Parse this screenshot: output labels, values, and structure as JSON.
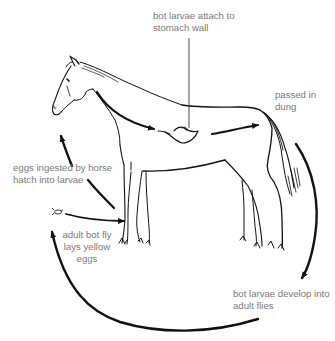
{
  "diagram": {
    "subject": "horse",
    "colors": {
      "background": "#ffffff",
      "line": "#111111",
      "label_text": "#7a7a7a"
    },
    "labels": {
      "stomach": {
        "line1": "bot larvae attach to",
        "line2": "stomach wall"
      },
      "dung": {
        "line1": "passed in",
        "line2": "dung"
      },
      "ingested": {
        "line1": "eggs ingested by horse",
        "line2": "hatch into larvae"
      },
      "adult_fly": {
        "line1": "adult bot fly",
        "line2": "lays yellow",
        "line3": "eggs"
      },
      "develop": {
        "line1": "bot larvae develop into",
        "line2": "adult flies"
      }
    },
    "icons": {
      "fly": "bot-fly-icon",
      "horse": "horse-outline"
    }
  }
}
